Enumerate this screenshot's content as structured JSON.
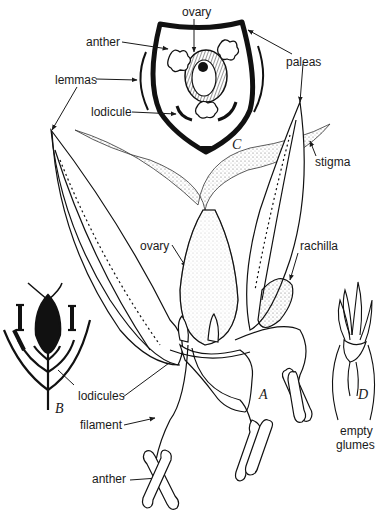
{
  "diagram": {
    "panels": {
      "A": "A",
      "B": "B",
      "C": "C",
      "D": "D"
    },
    "labels": {
      "ovary_top": "ovary",
      "anther_top": "anther",
      "paleas": "paleas",
      "lemmas": "lemmas",
      "lodicule": "lodicule",
      "stigma": "stigma",
      "ovary_mid": "ovary",
      "rachilla": "rachilla",
      "lodicules": "lodicules",
      "filament": "filament",
      "anther_bottom": "anther",
      "empty_glumes_1": "empty",
      "empty_glumes_2": "glumes"
    }
  }
}
